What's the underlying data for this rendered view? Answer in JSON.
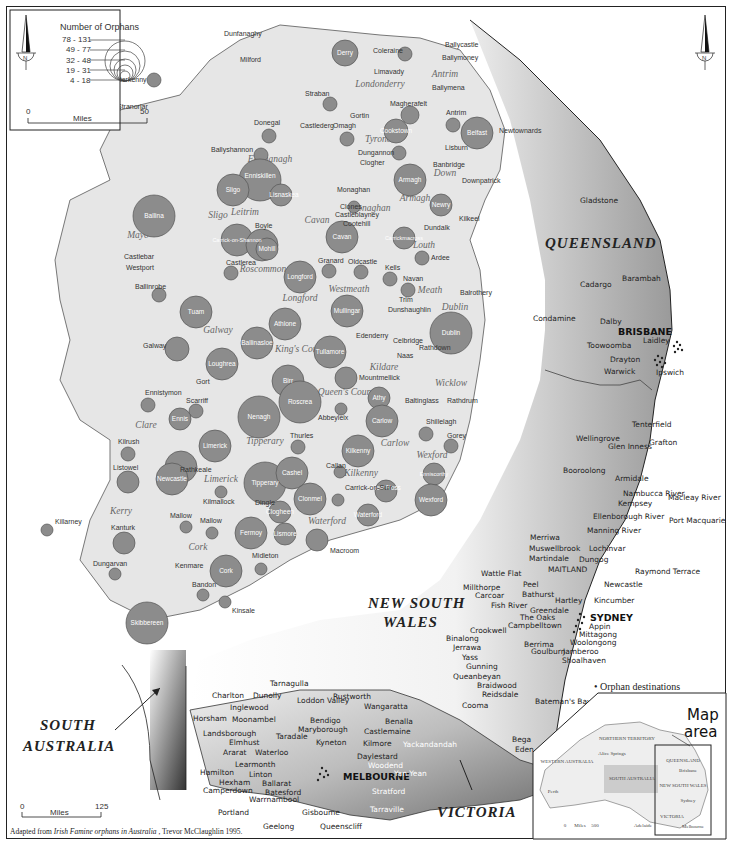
{
  "legend": {
    "title": "Number of Orphans",
    "classes": [
      "78 - 131",
      "49 - 77",
      "32 - 48",
      "19 - 31",
      "4 - 18"
    ]
  },
  "ireland_scale": {
    "start": "0",
    "unit": "Miles",
    "end": "50"
  },
  "australia_scale": {
    "start": "0",
    "unit": "Miles",
    "end": "125"
  },
  "north_label": "N",
  "caption": {
    "prefix": "Adapted from ",
    "title": "Irish Famine orphans in Australia",
    "suffix": " , Trevor McClaughlin 1995."
  },
  "orphan_destinations_note": [
    "• Orphan destinations",
    "where known"
  ],
  "map_area_label": [
    "Map",
    "area"
  ],
  "counties": [
    "Donegal",
    "Londonderry",
    "Antrim",
    "Tyrone",
    "Fermanagh",
    "Down",
    "Armagh",
    "Monaghan",
    "Mayo",
    "Sligo",
    "Leitrim",
    "Cavan",
    "Louth",
    "Roscommon",
    "Longford",
    "Westmeath",
    "Meath",
    "Dublin",
    "Galway",
    "King's County",
    "Kildare",
    "Wicklow",
    "Queen's County",
    "Clare",
    "Tipperary",
    "Carlow",
    "Wexford",
    "Limerick",
    "Kilkenny",
    "Kerry",
    "Waterford",
    "Cork"
  ],
  "workhouse_unions": [
    {
      "name": "Derry",
      "size": 2
    },
    {
      "name": "Coleraine",
      "size": 1
    },
    {
      "name": "Letterkenny",
      "size": 1
    },
    {
      "name": "Straban",
      "size": 1
    },
    {
      "name": "Magherafelt",
      "size": 1
    },
    {
      "name": "Antrim",
      "size": 1
    },
    {
      "name": "Belfast",
      "size": 4
    },
    {
      "name": "Cookstown",
      "size": 2
    },
    {
      "name": "Omagh",
      "size": 1
    },
    {
      "name": "Donegal",
      "size": 1
    },
    {
      "name": "Ballyshannon",
      "size": 1
    },
    {
      "name": "Dungannon",
      "size": 1
    },
    {
      "name": "Enniskillen",
      "size": 5
    },
    {
      "name": "Lisnaskea",
      "size": 2
    },
    {
      "name": "Armagh",
      "size": 3
    },
    {
      "name": "Newry",
      "size": 2
    },
    {
      "name": "Clones",
      "size": 1
    },
    {
      "name": "Sligo",
      "size": 3
    },
    {
      "name": "Ballina",
      "size": 5
    },
    {
      "name": "Carrick-on-Shannon",
      "size": 3
    },
    {
      "name": "Boyle",
      "size": 3
    },
    {
      "name": "Mohill",
      "size": 2
    },
    {
      "name": "Cavan",
      "size": 3
    },
    {
      "name": "Carrickmacross",
      "size": 2
    },
    {
      "name": "Castlerea",
      "size": 1
    },
    {
      "name": "Longford",
      "size": 3
    },
    {
      "name": "Granard",
      "size": 1
    },
    {
      "name": "Oldcastle",
      "size": 1
    },
    {
      "name": "Kells",
      "size": 1
    },
    {
      "name": "Navan",
      "size": 1
    },
    {
      "name": "Ardee",
      "size": 1
    },
    {
      "name": "Ballinrobe",
      "size": 1
    },
    {
      "name": "Tuam",
      "size": 3
    },
    {
      "name": "Mullingar",
      "size": 3
    },
    {
      "name": "Athlone",
      "size": 3
    },
    {
      "name": "Galway",
      "size": 2
    },
    {
      "name": "Ballinasloe",
      "size": 3
    },
    {
      "name": "Dublin",
      "size": 4
    },
    {
      "name": "Tullamore",
      "size": 3
    },
    {
      "name": "Loughrea",
      "size": 3
    },
    {
      "name": "Mountmellick",
      "size": 2
    },
    {
      "name": "Birr",
      "size": 3
    },
    {
      "name": "Roscrea",
      "size": 4
    },
    {
      "name": "Athy",
      "size": 2
    },
    {
      "name": "Nenagh",
      "size": 4
    },
    {
      "name": "Scarriff",
      "size": 1
    },
    {
      "name": "Ennistymon",
      "size": 1
    },
    {
      "name": "Ennis",
      "size": 2
    },
    {
      "name": "Abbeyleix",
      "size": 1
    },
    {
      "name": "Carlow",
      "size": 3
    },
    {
      "name": "Shillelagh",
      "size": 1
    },
    {
      "name": "Gorey",
      "size": 1
    },
    {
      "name": "Thurles",
      "size": 1
    },
    {
      "name": "Limerick",
      "size": 3
    },
    {
      "name": "Kilkenny",
      "size": 3
    },
    {
      "name": "Callan",
      "size": 1
    },
    {
      "name": "Kilrush",
      "size": 1
    },
    {
      "name": "Listowel",
      "size": 2
    },
    {
      "name": "Rathkeale",
      "size": 3
    },
    {
      "name": "Newcastle",
      "size": 3
    },
    {
      "name": "Tipperary",
      "size": 5
    },
    {
      "name": "Cashel",
      "size": 3
    },
    {
      "name": "Clonmel",
      "size": 3
    },
    {
      "name": "Carrick-on-Suir",
      "size": 1
    },
    {
      "name": "New Ross",
      "size": 2
    },
    {
      "name": "Enniscorthy",
      "size": 2
    },
    {
      "name": "Wexford",
      "size": 3
    },
    {
      "name": "Waterford",
      "size": 2
    },
    {
      "name": "Kilmallock",
      "size": 1
    },
    {
      "name": "Clogheen",
      "size": 2
    },
    {
      "name": "Dingle",
      "size": 1
    },
    {
      "name": "Killarney",
      "size": 2
    },
    {
      "name": "Kanturk",
      "size": 1
    },
    {
      "name": "Mallow",
      "size": 1
    },
    {
      "name": "Fermoy",
      "size": 3
    },
    {
      "name": "Lismore",
      "size": 2
    },
    {
      "name": "Dungarvan",
      "size": 2
    },
    {
      "name": "Kenmare",
      "size": 1
    },
    {
      "name": "Macroom",
      "size": 0
    },
    {
      "name": "Cork",
      "size": 3
    },
    {
      "name": "Midleton",
      "size": 1
    },
    {
      "name": "Bandon",
      "size": 1
    },
    {
      "name": "Kinsale",
      "size": 1
    },
    {
      "name": "Skibbereen",
      "size": 4
    },
    {
      "name": "Bantry",
      "size": 1
    }
  ],
  "irish_towns": [
    "Dunfanaghy",
    "Milford",
    "Stranorlar",
    "Limavady",
    "Ballycastle",
    "Ballymoney",
    "Ballymena",
    "Gortin",
    "Castlederg",
    "Clogher",
    "Monaghan",
    "Castleblayney",
    "Cootehill",
    "Dundalk",
    "Kilkeel",
    "Banbridge",
    "Lisburn",
    "Newtownards",
    "Downpatrick",
    "Castlebar",
    "Westport",
    "Trim",
    "Dunshaughlin",
    "Balrothery",
    "Edenderry",
    "Celbridge",
    "Rathdown",
    "Naas",
    "Baltinglass",
    "Rathdrum",
    "Gort"
  ],
  "states": {
    "queensland": "QUEENSLAND",
    "nsw_line1": "NEW SOUTH",
    "nsw_line2": "WALES",
    "sa_line1": "SOUTH",
    "sa_line2": "AUSTRALIA",
    "victoria": "VICTORIA"
  },
  "major_cities": {
    "brisbane": "BRISBANE",
    "sydney": "SYDNEY",
    "melbourne": "MELBOURNE",
    "maitland": "MAITLAND"
  },
  "qld_places": [
    "Gladstone",
    "Barambah",
    "Cadargo",
    "Condamine",
    "Dalby",
    "Laidley",
    "Toowoomba",
    "Drayton",
    "Ipswich",
    "Warwick"
  ],
  "nsw_places": [
    "Tenterfield",
    "Wellingrove",
    "Glen Inness",
    "Grafton",
    "Booroolong",
    "Armidale",
    "Nambucca River",
    "Kempsey",
    "Macleay River",
    "Ellenborough River",
    "Port Macquarie",
    "Manning River",
    "Merriwa",
    "Muswellbrook",
    "Lochinvar",
    "Martindale",
    "Dungog",
    "Raymond Terrace",
    "Newcastle",
    "Wattle Flat",
    "Peel",
    "Millthorpe",
    "Carcoar",
    "Bathurst",
    "Fish River",
    "Hartley",
    "Kincumber",
    "Greendale",
    "The Oaks",
    "Campbelltown",
    "Appin",
    "Mittagong",
    "Woolongong",
    "Crookwell",
    "Binalong",
    "Jerrawa",
    "Yass",
    "Berrima",
    "Goulburn",
    "Jamberoo",
    "Gunning",
    "Shoalhaven",
    "Queanbeyan",
    "Braidwood",
    "Reidsdale",
    "Bateman's Bay",
    "Cooma",
    "Bega",
    "Eden"
  ],
  "vic_places": [
    "Tarnagulla",
    "Charlton",
    "Dunolly",
    "Loddon Valley",
    "Rustworth",
    "Wangaratta",
    "Inglewood",
    "Horsham",
    "Moonambel",
    "Bendigo",
    "Benalla",
    "Maryborough",
    "Castlemaine",
    "Landsborough",
    "Taradale",
    "Elmhust",
    "Kyneton",
    "Kilmore",
    "Yackandandah",
    "Ararat",
    "Waterloo",
    "Daylestard",
    "Woodend",
    "Learmonth",
    "Yan Yean",
    "Hamilton",
    "Linton",
    "Hexham",
    "Ballarat",
    "Camperdown",
    "Batesford",
    "Stratford",
    "Warrnambool",
    "Tarraville",
    "Portland",
    "Gisboume",
    "Geelong",
    "Queenscliff"
  ],
  "inset": {
    "labels": [
      "NORTHERN TERRITORY",
      "WESTERN AUSTRALIA",
      "SOUTH AUSTRALIA",
      "QUEENSLAND",
      "NEW SOUTH WALES",
      "VICTORIA"
    ],
    "cities": [
      "Alice Springs",
      "Perth",
      "Adelaide",
      "Brisbane",
      "Sydney",
      "Melbourne"
    ],
    "scale": {
      "start": "0",
      "unit": "Miles",
      "end": "500"
    }
  }
}
